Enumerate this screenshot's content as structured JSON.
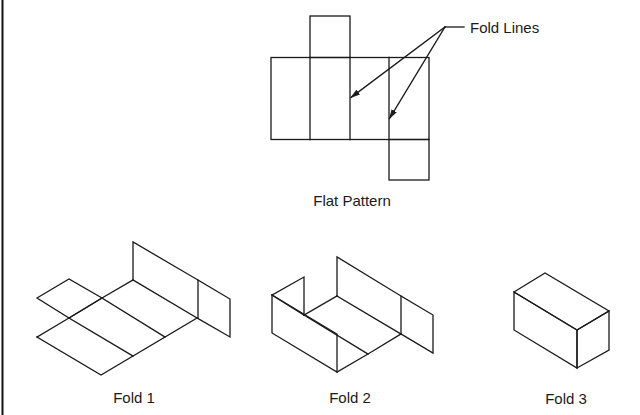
{
  "diagram": {
    "colors": {
      "stroke": "#1a1a1a",
      "background": "#ffffff",
      "left_border": "#111111"
    },
    "flat_pattern": {
      "label": "Flat Pattern",
      "callout": {
        "label": "Fold Lines",
        "arrow_count": 2
      }
    },
    "stages": [
      {
        "label": "Fold 1"
      },
      {
        "label": "Fold 2"
      },
      {
        "label": "Fold 3"
      }
    ]
  }
}
